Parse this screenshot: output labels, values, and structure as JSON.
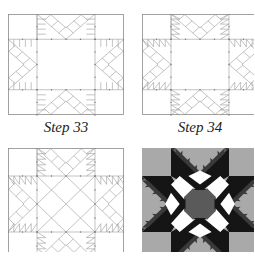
{
  "figure": {
    "panels": [
      {
        "id": "step-33",
        "caption": "Step 33",
        "kind": "line-diagram"
      },
      {
        "id": "step-34",
        "caption": "Step 34",
        "kind": "line-diagram"
      },
      {
        "id": "step-35",
        "caption": "",
        "kind": "line-diagram"
      },
      {
        "id": "finished-block",
        "caption": "",
        "kind": "shaded-quilt-block"
      }
    ],
    "colors": {
      "line": "#9a9a9a",
      "outline": "#8a8a8a",
      "background_gray": "#a9a9a9",
      "star_black": "#151515",
      "star_dark": "#3a3a3a",
      "center_gray": "#5a5a5a",
      "white": "#ffffff"
    }
  }
}
